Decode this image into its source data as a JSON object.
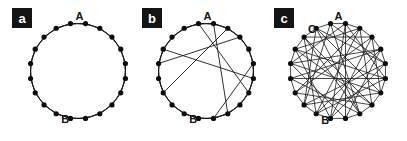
{
  "figure": {
    "background_color": "#ffffff",
    "ink_color": "#1a1a1a",
    "node_color": "#0d0d0d",
    "badge_bg_color": "#141414",
    "badge_text_color": "#ffffff",
    "width": 407,
    "height": 141
  },
  "panels": [
    {
      "id": "a",
      "badge_label": "a",
      "badge": {
        "x": 12,
        "y": 8,
        "w": 20,
        "h": 20
      },
      "center": {
        "x": 78,
        "y": 71
      },
      "radius": 48,
      "node_count": 20,
      "node_radius": 2.6,
      "ring_neighbors": 2,
      "shortcut_count": 0,
      "rotation_deg": -99,
      "edge_width": 0.9,
      "vertex_labels": [
        {
          "text": "A",
          "node_index": 1,
          "dx": -6,
          "dy": -4
        },
        {
          "text": "B",
          "node_index": 12,
          "dx": 9,
          "dy": 9
        }
      ],
      "shortcuts": []
    },
    {
      "id": "b",
      "badge_label": "b",
      "badge": {
        "x": 142,
        "y": 8,
        "w": 20,
        "h": 20
      },
      "center": {
        "x": 206,
        "y": 71
      },
      "radius": 48,
      "node_count": 20,
      "node_radius": 2.6,
      "ring_neighbors": 2,
      "shortcut_count": 6,
      "rotation_deg": -99,
      "edge_width": 0.9,
      "vertex_labels": [
        {
          "text": "A",
          "node_index": 1,
          "dx": -6,
          "dy": -4
        },
        {
          "text": "B",
          "node_index": 12,
          "dx": 9,
          "dy": 9
        }
      ],
      "shortcuts": [
        [
          1,
          9
        ],
        [
          2,
          14
        ],
        [
          3,
          16
        ],
        [
          5,
          10
        ],
        [
          0,
          7
        ],
        [
          17,
          6
        ]
      ]
    },
    {
      "id": "c",
      "badge_label": "c",
      "badge": {
        "x": 274,
        "y": 8,
        "w": 20,
        "h": 20
      },
      "center": {
        "x": 338,
        "y": 71
      },
      "radius": 48,
      "node_count": 20,
      "node_radius": 2.6,
      "ring_neighbors": 1,
      "shortcut_count": 38,
      "rotation_deg": -99,
      "edge_width": 0.8,
      "vertex_labels": [
        {
          "text": "A",
          "node_index": 1,
          "dx": -7,
          "dy": -4
        },
        {
          "text": "C",
          "node_index": 18,
          "dx": 8,
          "dy": -4
        },
        {
          "text": "B",
          "node_index": 12,
          "dx": 9,
          "dy": 10
        }
      ],
      "shortcuts": [
        [
          0,
          5
        ],
        [
          0,
          9
        ],
        [
          0,
          13
        ],
        [
          1,
          6
        ],
        [
          1,
          11
        ],
        [
          1,
          16
        ],
        [
          2,
          8
        ],
        [
          2,
          12
        ],
        [
          2,
          17
        ],
        [
          3,
          7
        ],
        [
          3,
          14
        ],
        [
          3,
          18
        ],
        [
          4,
          10
        ],
        [
          4,
          15
        ],
        [
          5,
          11
        ],
        [
          5,
          19
        ],
        [
          6,
          12
        ],
        [
          6,
          17
        ],
        [
          7,
          13
        ],
        [
          7,
          16
        ],
        [
          8,
          14
        ],
        [
          8,
          18
        ],
        [
          9,
          15
        ],
        [
          9,
          19
        ],
        [
          10,
          16
        ],
        [
          10,
          1
        ],
        [
          11,
          17
        ],
        [
          11,
          3
        ],
        [
          12,
          18
        ],
        [
          12,
          4
        ],
        [
          13,
          19
        ],
        [
          13,
          5
        ],
        [
          14,
          2
        ],
        [
          15,
          6
        ],
        [
          16,
          4
        ],
        [
          17,
          8
        ],
        [
          18,
          9
        ],
        [
          19,
          7
        ]
      ]
    }
  ]
}
